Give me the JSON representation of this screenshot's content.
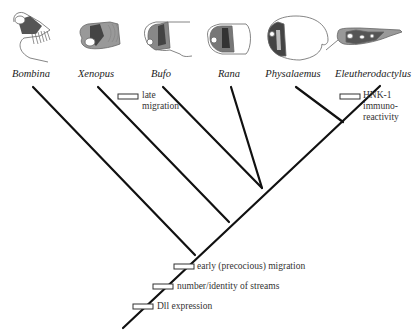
{
  "diagram": {
    "type": "phylogenetic-tree",
    "taxa": [
      {
        "name": "Bombina",
        "tip": [
          33,
          87
        ],
        "join": [
          195,
          255
        ],
        "label_x": 31
      },
      {
        "name": "Xenopus",
        "tip": [
          98,
          87
        ],
        "join": [
          229,
          222
        ],
        "label_x": 96
      },
      {
        "name": "Bufo",
        "tip": [
          163,
          87
        ],
        "join": [
          262,
          188
        ],
        "label_x": 161
      },
      {
        "name": "Rana",
        "tip": [
          231,
          87
        ],
        "join": [
          262,
          188
        ],
        "label_x": 229
      },
      {
        "name": "Physalaemus",
        "tip": [
          296,
          87
        ],
        "join": [
          343,
          122
        ],
        "label_x": 293
      },
      {
        "name": "Eleutherodactylus",
        "tip": [
          380,
          86
        ],
        "join": [
          343,
          122
        ],
        "label_x": 374
      }
    ],
    "root": {
      "start": [
        123,
        328
      ],
      "end": [
        343,
        122
      ]
    },
    "characters": [
      {
        "label_lines": [
          "late",
          "migration"
        ],
        "bar": [
          128,
          97
        ],
        "label_pos": [
          142,
          90
        ]
      },
      {
        "label_lines": [
          "HNK-1",
          "immuno-",
          "reactivity"
        ],
        "bar": [
          350,
          97
        ],
        "label_pos": [
          362,
          90
        ]
      },
      {
        "label_lines": [
          "early (precocious) migration"
        ],
        "bar": [
          184,
          267
        ],
        "label_pos": [
          196,
          261
        ]
      },
      {
        "label_lines": [
          "number/identity of streams"
        ],
        "bar": [
          163,
          287
        ],
        "label_pos": [
          177,
          281
        ]
      },
      {
        "label_lines": [
          "Dll expression"
        ],
        "bar": [
          143,
          307
        ],
        "label_pos": [
          157,
          301
        ]
      }
    ],
    "colors": {
      "line": "#111111",
      "bar_fill": "#ffffff",
      "embryo_dark": "#555555",
      "embryo_mid": "#999999"
    }
  }
}
